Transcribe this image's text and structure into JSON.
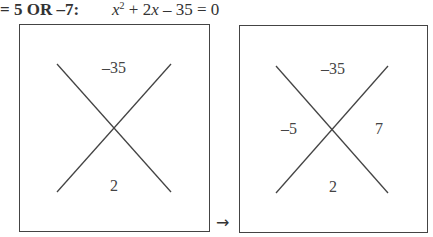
{
  "header": {
    "answer_text": "= 5 OR –7:",
    "equation": {
      "var": "x",
      "exp": "2",
      "rest": " + 2",
      "var2": "x",
      "tail": " – 35 = 0"
    }
  },
  "diagrams": [
    {
      "top": "–35",
      "bottom": "2",
      "left": "",
      "right": ""
    },
    {
      "top": "–35",
      "bottom": "2",
      "left": "–5",
      "right": "7"
    }
  ],
  "arrow_glyph": "→"
}
